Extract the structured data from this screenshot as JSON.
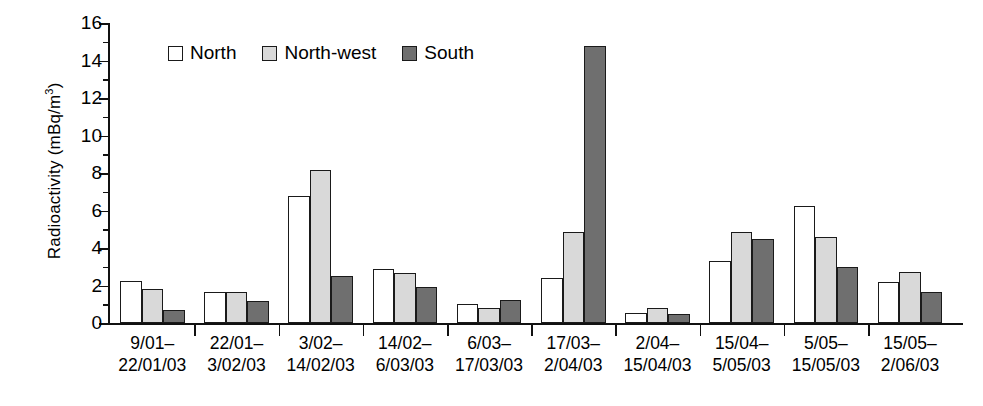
{
  "chart_data": {
    "type": "bar",
    "title": "",
    "xlabel": "",
    "ylabel": "Radioactivity (mBq/m3)",
    "ylabel_prefix": "Radioactivity (mBq/m",
    "ylabel_sup": "3",
    "ylabel_suffix": ")",
    "ylim": [
      0,
      16
    ],
    "ytick_step": 2,
    "yminor_step": 1,
    "grid": false,
    "legend_position": "top-left inside",
    "categories": [
      "9/01–\n22/01/03",
      "22/01–\n3/02/03",
      "3/02–\n14/02/03",
      "14/02–\n6/03/03",
      "6/03–\n17/03/03",
      "17/03–\n2/04/03",
      "2/04–\n15/04/03",
      "15/04–\n5/05/03",
      "5/05–\n15/05/03",
      "15/05–\n2/06/03"
    ],
    "category_lines": [
      [
        "9/01–",
        "22/01/03"
      ],
      [
        "22/01–",
        "3/02/03"
      ],
      [
        "3/02–",
        "14/02/03"
      ],
      [
        "14/02–",
        "6/03/03"
      ],
      [
        "6/03–",
        "17/03/03"
      ],
      [
        "17/03–",
        "2/04/03"
      ],
      [
        "2/04–",
        "15/04/03"
      ],
      [
        "15/04–",
        "5/05/03"
      ],
      [
        "5/05–",
        "15/05/03"
      ],
      [
        "15/05–",
        "2/06/03"
      ]
    ],
    "ytick_labels": [
      "0",
      "2",
      "4",
      "6",
      "8",
      "10",
      "12",
      "14",
      "16"
    ],
    "ytick_values": [
      0,
      2,
      4,
      6,
      8,
      10,
      12,
      14,
      16
    ],
    "series": [
      {
        "name": "North",
        "color": "#ffffff",
        "values": [
          2.25,
          1.65,
          6.8,
          2.9,
          1.0,
          2.4,
          0.55,
          3.3,
          6.25,
          2.2
        ]
      },
      {
        "name": "North-west",
        "color": "#d9d9d9",
        "values": [
          1.8,
          1.65,
          8.15,
          2.65,
          0.8,
          4.85,
          0.8,
          4.85,
          4.6,
          2.7
        ]
      },
      {
        "name": "South",
        "color": "#6f6f6f",
        "values": [
          0.7,
          1.15,
          2.5,
          1.9,
          1.25,
          14.75,
          0.5,
          4.5,
          3.0,
          1.65
        ]
      }
    ]
  },
  "legend": {
    "items": [
      {
        "label": "North",
        "swatch": "north"
      },
      {
        "label": "North-west",
        "swatch": "northwest"
      },
      {
        "label": "South",
        "swatch": "south"
      }
    ]
  }
}
